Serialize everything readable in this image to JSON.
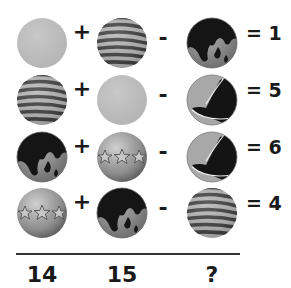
{
  "puzzle": {
    "rows": [
      {
        "items": [
          "gray-ball",
          "striped-ball",
          "globe-ball"
        ],
        "ops": [
          "+",
          "-"
        ],
        "result": "= 1"
      },
      {
        "items": [
          "striped-ball",
          "gray-ball",
          "bird-ball"
        ],
        "ops": [
          "+",
          "-"
        ],
        "result": "= 5"
      },
      {
        "items": [
          "globe-ball",
          "star-ball",
          "bird-ball"
        ],
        "ops": [
          "+",
          "-"
        ],
        "result": "= 6"
      },
      {
        "items": [
          "star-ball",
          "globe-ball",
          "striped-ball"
        ],
        "ops": [
          "+",
          "-"
        ],
        "result": "= 4"
      }
    ],
    "answers": [
      "14",
      "15",
      "?"
    ]
  }
}
